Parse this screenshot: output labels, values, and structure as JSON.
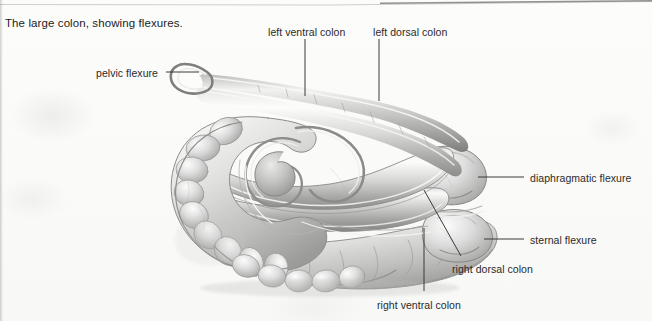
{
  "figure": {
    "caption": "The large colon, showing flexures.",
    "style": "grayscale pencil and wash scanned textbook plate",
    "colors": {
      "page_background": "#fbfbfa",
      "text": "#1d1d1d",
      "label_text": "#2a2a2a",
      "leader_line": "#3a3a3a",
      "organ_outline": "#8e8e8e",
      "organ_fill_light": "#f2f2f1",
      "organ_fill_mid": "#cfcfcd",
      "organ_fill_dark": "#9b9b99",
      "scan_edge": "#969694"
    }
  },
  "labels": [
    {
      "id": "pelvic-flexure",
      "text": "pelvic flexure",
      "text_x": 96,
      "text_y": 67,
      "align": "left",
      "leader": {
        "type": "line",
        "x1": 166,
        "y1": 72,
        "x2": 199,
        "y2": 72
      }
    },
    {
      "id": "left-ventral-colon",
      "text": "left ventral colon",
      "text_x": 268,
      "text_y": 26,
      "align": "left",
      "leader": {
        "type": "line",
        "x1": 305,
        "y1": 39,
        "x2": 305,
        "y2": 96
      }
    },
    {
      "id": "left-dorsal-colon",
      "text": "left dorsal colon",
      "text_x": 373,
      "text_y": 26,
      "align": "left",
      "leader": {
        "type": "line",
        "x1": 379,
        "y1": 39,
        "x2": 379,
        "y2": 101
      }
    },
    {
      "id": "diaphragmatic-flexure",
      "text": "diaphragmatic flexure",
      "text_x": 530,
      "text_y": 172,
      "align": "left",
      "leader": {
        "type": "line",
        "x1": 478,
        "y1": 177,
        "x2": 524,
        "y2": 177
      }
    },
    {
      "id": "sternal-flexure",
      "text": "sternal flexure",
      "text_x": 530,
      "text_y": 234,
      "align": "left",
      "leader": {
        "type": "line",
        "x1": 484,
        "y1": 239,
        "x2": 524,
        "y2": 239
      }
    },
    {
      "id": "right-dorsal-colon",
      "text": "right dorsal colon",
      "text_x": 452,
      "text_y": 263,
      "align": "left",
      "leader": {
        "type": "line",
        "x1": 424,
        "y1": 190,
        "x2": 461,
        "y2": 256
      }
    },
    {
      "id": "right-ventral-colon",
      "text": "right ventral colon",
      "text_x": 377,
      "text_y": 299,
      "align": "left",
      "leader": {
        "type": "line",
        "x1": 424,
        "y1": 228,
        "x2": 424,
        "y2": 291
      }
    }
  ]
}
